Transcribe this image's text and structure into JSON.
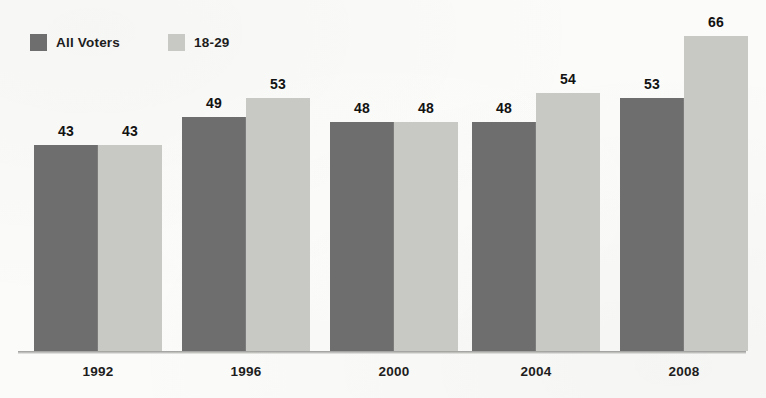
{
  "chart_data": {
    "type": "bar",
    "title": "",
    "subtitle": "",
    "xlabel": "",
    "ylabel": "",
    "categories": [
      "1992",
      "1996",
      "2000",
      "2004",
      "2008"
    ],
    "series": [
      {
        "name": "All Voters",
        "color": "#6e6e6e",
        "values": [
          43,
          49,
          48,
          48,
          53
        ]
      },
      {
        "name": "18-29",
        "color": "#c8c9c4",
        "values": [
          43,
          53,
          48,
          54,
          66
        ]
      }
    ],
    "ylim": [
      0,
      70
    ],
    "grid": false,
    "legend_position": "top-left",
    "value_labels": true,
    "axis_baseline": true
  },
  "legend": {
    "items": [
      {
        "label": "All Voters",
        "swatch_color": "#6e6e6e",
        "swatch_icon": "square-swatch-icon"
      },
      {
        "label": "18-29",
        "swatch_color": "#c8c9c4",
        "swatch_icon": "square-swatch-icon"
      }
    ]
  },
  "axis": {
    "categories": [
      "1992",
      "1996",
      "2000",
      "2004",
      "2008"
    ]
  },
  "bars": [
    {
      "group": "1992",
      "series": "All Voters",
      "value": 43,
      "label": "43"
    },
    {
      "group": "1992",
      "series": "18-29",
      "value": 43,
      "label": "43"
    },
    {
      "group": "1996",
      "series": "All Voters",
      "value": 49,
      "label": "49"
    },
    {
      "group": "1996",
      "series": "18-29",
      "value": 53,
      "label": "53"
    },
    {
      "group": "2000",
      "series": "All Voters",
      "value": 48,
      "label": "48"
    },
    {
      "group": "2000",
      "series": "18-29",
      "value": 48,
      "label": "48"
    },
    {
      "group": "2004",
      "series": "All Voters",
      "value": 48,
      "label": "48"
    },
    {
      "group": "2004",
      "series": "18-29",
      "value": 54,
      "label": "54"
    },
    {
      "group": "2008",
      "series": "All Voters",
      "value": 53,
      "label": "53"
    },
    {
      "group": "2008",
      "series": "18-29",
      "value": 66,
      "label": "66"
    }
  ],
  "colors": {
    "background": "#fbfbf9",
    "all_voters": "#6e6e6e",
    "young_voters": "#c8c9c4",
    "text": "#1d1d1d",
    "axis": "#8a8a87"
  }
}
